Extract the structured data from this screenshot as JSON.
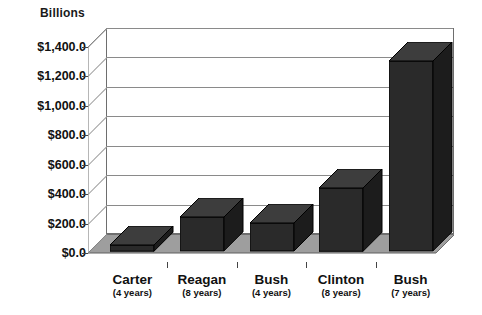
{
  "chart_data": {
    "type": "bar",
    "title": "",
    "subtitle": "",
    "axis_title": "Billions",
    "xlabel": "",
    "ylabel": "Billions",
    "ylim": [
      0,
      1400
    ],
    "ytick_step": 200,
    "grid": true,
    "legend": "none",
    "style": "3d-column",
    "bar_color": "#2a2a2a",
    "plot_border_color": "#6e6e6e",
    "gridline_color": "#8a8a8a",
    "ytick_labels": [
      "$1,400.0",
      "$1,200.0",
      "$1,000.0",
      "$800.0",
      "$600.0",
      "$400.0",
      "$200.0",
      "$0.0"
    ],
    "ytick_values": [
      1400,
      1200,
      1000,
      800,
      600,
      400,
      200,
      0
    ],
    "categories": [
      "Carter",
      "Reagan",
      "Bush",
      "Clinton",
      "Bush"
    ],
    "category_sublabels": [
      "(4 years)",
      "(8 years)",
      "(4 years)",
      "(8 years)",
      "(7 years)"
    ],
    "values": [
      42,
      230,
      190,
      430,
      1290
    ],
    "series": [
      {
        "name": "",
        "values": [
          42,
          230,
          190,
          430,
          1290
        ]
      }
    ],
    "points": [
      {
        "category": "Carter",
        "sublabel": "(4 years)",
        "value": 42
      },
      {
        "category": "Reagan",
        "sublabel": "(8 years)",
        "value": 230
      },
      {
        "category": "Bush",
        "sublabel": "(4 years)",
        "value": 190
      },
      {
        "category": "Clinton",
        "sublabel": "(8 years)",
        "value": 430
      },
      {
        "category": "Bush",
        "sublabel": "(7 years)",
        "value": 1290
      }
    ]
  }
}
